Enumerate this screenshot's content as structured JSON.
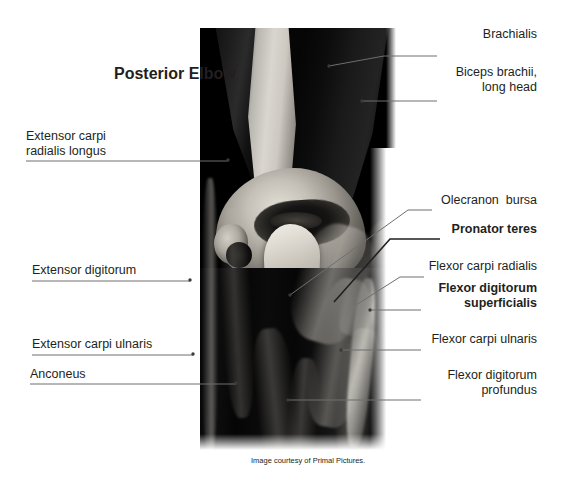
{
  "title": "Posterior\nElbow",
  "caption": "Image courtesy of Primal Pictures.",
  "colors": {
    "text": "#231f20",
    "leader": "#6f6f70",
    "leader_bold": "#231f20",
    "background": "#ffffff"
  },
  "labels_left": [
    {
      "name": "extensor-carpi-radialis-longus",
      "text": "Extensor carpi\nradialis longus",
      "bold": false
    },
    {
      "name": "extensor-digitorum",
      "text": "Extensor digitorum",
      "bold": false
    },
    {
      "name": "extensor-carpi-ulnaris",
      "text": "Extensor carpi ulnaris",
      "bold": false
    },
    {
      "name": "anconeus",
      "text": "Anconeus",
      "bold": false
    }
  ],
  "labels_right": [
    {
      "name": "brachialis",
      "text": "Brachialis",
      "bold": false
    },
    {
      "name": "biceps-brachii-long-head",
      "text": "Biceps brachii,\nlong head",
      "bold": false
    },
    {
      "name": "olecranon-bursa",
      "text": "Olecranon  bursa",
      "bold": false
    },
    {
      "name": "pronator-teres",
      "text": "Pronator teres",
      "bold": true
    },
    {
      "name": "flexor-carpi-radialis",
      "text": "Flexor carpi radialis",
      "bold": false
    },
    {
      "name": "flexor-digitorum-superficialis",
      "text": "Flexor digitorum\nsuperficialis",
      "bold": true
    },
    {
      "name": "flexor-carpi-ulnaris",
      "text": "Flexor carpi ulnaris",
      "bold": false
    },
    {
      "name": "flexor-digitorum-profundus",
      "text": "Flexor digitorum\nprofundus",
      "bold": false
    }
  ]
}
